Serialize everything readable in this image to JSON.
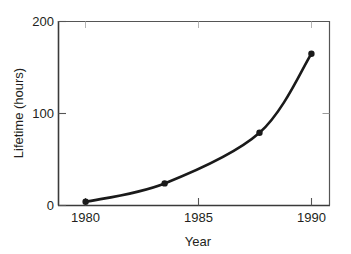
{
  "chart_data": {
    "type": "line",
    "title": "",
    "subtitle": "",
    "xlabel": "Year",
    "ylabel": "Lifetime (hours)",
    "xlim": [
      1978.8,
      1990.8
    ],
    "ylim": [
      0,
      200
    ],
    "xticks": [
      1980,
      1985,
      1990
    ],
    "xtick_labels": [
      "1980",
      "1985",
      "1990"
    ],
    "yticks": [
      0,
      100,
      200
    ],
    "ytick_labels": [
      "0",
      "100",
      "200"
    ],
    "grid": false,
    "legend": null,
    "legend_position": "none",
    "series": [
      {
        "name": "Lifetime",
        "marker": "filled-circle",
        "line_color": "#1a1a1a",
        "marker_color": "#1a1a1a",
        "x": [
          1980.0,
          1983.5,
          1987.7,
          1990.0
        ],
        "y": [
          4,
          24,
          79,
          165
        ]
      }
    ],
    "annotations": []
  },
  "axes": {
    "y_tick_200": "200",
    "y_tick_100": "100",
    "y_tick_0": "0",
    "x_tick_1980": "1980",
    "x_tick_1985": "1985",
    "x_tick_1990": "1990",
    "y_axis_title": "Lifetime (hours)",
    "x_axis_title": "Year"
  },
  "colors": {
    "ink": "#231f20",
    "frame": "#4d4d4d",
    "curve": "#1a1a1a",
    "background": "#ffffff"
  }
}
